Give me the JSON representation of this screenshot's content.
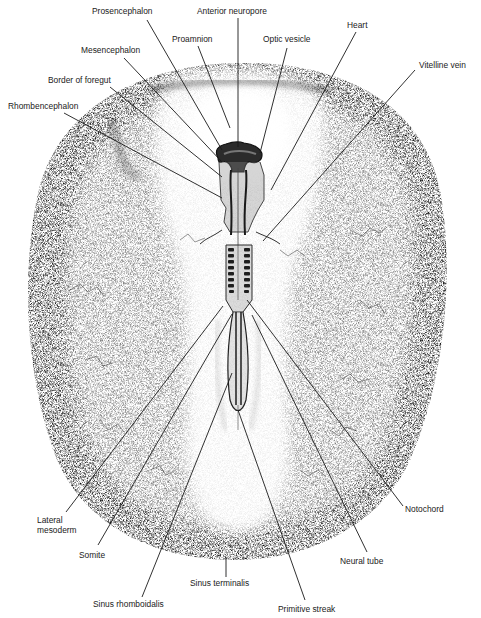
{
  "figure": {
    "colors": {
      "ink": "#1a1a1a",
      "stipple_dark": "#2a2a2a",
      "background": "#ffffff"
    }
  },
  "labels": [
    {
      "id": "prosencephalon",
      "text": "Prosencephalon",
      "x": 92,
      "y": 6,
      "line": [
        147,
        20,
        222,
        150
      ]
    },
    {
      "id": "anterior-neuropore",
      "text": "Anterior neuropore",
      "x": 197,
      "y": 6,
      "line": [
        238,
        18,
        238,
        147
      ]
    },
    {
      "id": "proamnion",
      "text": "Proamnion",
      "x": 172,
      "y": 34,
      "line": [
        198,
        46,
        230,
        128
      ]
    },
    {
      "id": "mesencephalon",
      "text": "Mesencephalon",
      "x": 81,
      "y": 45,
      "line": [
        124,
        58,
        222,
        162
      ]
    },
    {
      "id": "optic-vesicle",
      "text": "Optic vesicle",
      "x": 263,
      "y": 34,
      "line": [
        287,
        48,
        260,
        153
      ]
    },
    {
      "id": "heart",
      "text": "Heart",
      "x": 347,
      "y": 20,
      "line": [
        356,
        32,
        271,
        190
      ]
    },
    {
      "id": "border-of-foregut",
      "text": "Border of foregut",
      "x": 48,
      "y": 75,
      "line": [
        110,
        87,
        222,
        177
      ]
    },
    {
      "id": "vitelline-vein",
      "text": "Vitelline vein",
      "x": 419,
      "y": 60,
      "line": [
        415,
        70,
        263,
        241
      ]
    },
    {
      "id": "rhombencephalon",
      "text": "Rhombencephalon",
      "x": 8,
      "y": 101,
      "line": [
        64,
        113,
        222,
        198
      ]
    },
    {
      "id": "lateral-mesoderm",
      "text": "Lateral\nmesoderm",
      "x": 37,
      "y": 515,
      "line": [
        66,
        512,
        223,
        306
      ]
    },
    {
      "id": "somite",
      "text": "Somite",
      "x": 79,
      "y": 550,
      "line": [
        98,
        545,
        232,
        314
      ]
    },
    {
      "id": "sinus-rhomboidalis",
      "text": "Sinus rhomboidalis",
      "x": 93,
      "y": 599,
      "line": [
        142,
        597,
        232,
        373
      ]
    },
    {
      "id": "sinus-terminalis",
      "text": "Sinus terminalis",
      "x": 190,
      "y": 578,
      "line": [
        226,
        577,
        226,
        557
      ]
    },
    {
      "id": "primitive-streak",
      "text": "Primitive streak",
      "x": 278,
      "y": 604,
      "line": [
        305,
        600,
        238,
        410
      ]
    },
    {
      "id": "neural-tube",
      "text": "Neural tube",
      "x": 340,
      "y": 556,
      "line": [
        367,
        552,
        252,
        315
      ]
    },
    {
      "id": "notochord",
      "text": "Notochord",
      "x": 405,
      "y": 504,
      "line": [
        403,
        506,
        247,
        300
      ]
    }
  ]
}
